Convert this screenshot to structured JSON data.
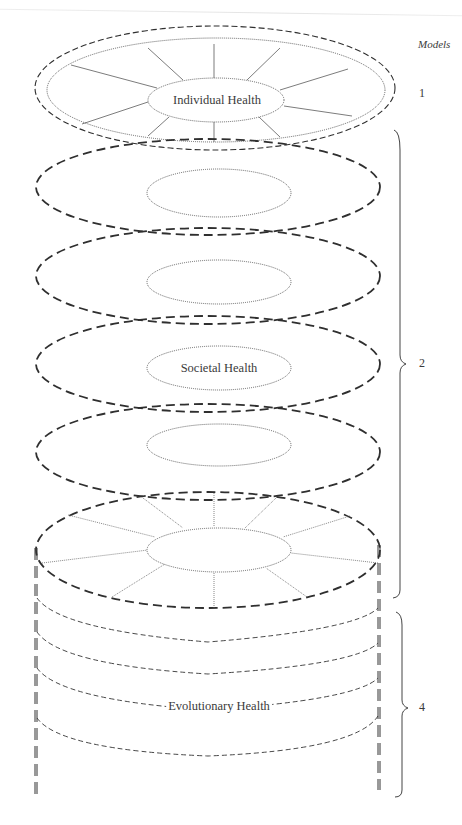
{
  "figure": {
    "models_header": "Models",
    "layers": [
      {
        "id": "individual",
        "label": "Individual Health",
        "model_number": "1"
      },
      {
        "id": "societal",
        "label": "Societal Health",
        "model_number": "2"
      },
      {
        "id": "evolutionary",
        "label": "Evolutionary Health",
        "model_number": "4"
      }
    ],
    "colors": {
      "line": "#2f2f2f",
      "dotted": "#555555",
      "background": "#ffffff"
    }
  }
}
